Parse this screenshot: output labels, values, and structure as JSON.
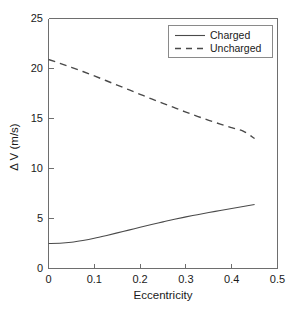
{
  "chart_data": {
    "type": "line",
    "title": "",
    "xlabel": "Eccentricity",
    "ylabel": "Δ V (m/s)",
    "xlim": [
      0,
      0.5
    ],
    "ylim": [
      0,
      25
    ],
    "xticks": [
      "0",
      "0.1",
      "0.2",
      "0.3",
      "0.4",
      "0.5"
    ],
    "xtick_values": [
      0,
      0.1,
      0.2,
      0.3,
      0.4,
      0.5
    ],
    "yticks": [
      "0",
      "5",
      "10",
      "15",
      "20",
      "25"
    ],
    "ytick_values": [
      0,
      5,
      10,
      15,
      20,
      25
    ],
    "grid": false,
    "legend_position": "top-right",
    "series": [
      {
        "name": "Charged",
        "style": "solid",
        "color": "#4a4a4a",
        "x": [
          0.0,
          0.025,
          0.05,
          0.075,
          0.1,
          0.125,
          0.15,
          0.175,
          0.2,
          0.225,
          0.25,
          0.275,
          0.3,
          0.325,
          0.35,
          0.375,
          0.4,
          0.425,
          0.45
        ],
        "values": [
          2.5,
          2.52,
          2.62,
          2.8,
          3.02,
          3.28,
          3.56,
          3.84,
          4.12,
          4.4,
          4.66,
          4.92,
          5.16,
          5.38,
          5.6,
          5.8,
          6.0,
          6.2,
          6.4
        ]
      },
      {
        "name": "Uncharged",
        "style": "dashed",
        "color": "#4a4a4a",
        "x": [
          0.0,
          0.025,
          0.05,
          0.075,
          0.1,
          0.125,
          0.15,
          0.175,
          0.2,
          0.225,
          0.25,
          0.275,
          0.3,
          0.325,
          0.35,
          0.375,
          0.4,
          0.425,
          0.45
        ],
        "values": [
          20.9,
          20.52,
          20.12,
          19.7,
          19.26,
          18.8,
          18.34,
          17.88,
          17.42,
          16.96,
          16.52,
          16.08,
          15.64,
          15.22,
          14.82,
          14.44,
          14.08,
          13.74,
          13.0
        ]
      }
    ]
  },
  "axes": {
    "y_title": "Δ V (m/s)",
    "x_title": "Eccentricity",
    "y_tick_labels": [
      "25",
      "20",
      "15",
      "10",
      "5",
      "0"
    ],
    "x_tick_labels": [
      "0",
      "0.1",
      "0.2",
      "0.3",
      "0.4",
      "0.5"
    ]
  },
  "legend": {
    "entries": [
      {
        "label": "Charged",
        "style": "solid"
      },
      {
        "label": "Uncharged",
        "style": "dashed"
      }
    ]
  }
}
